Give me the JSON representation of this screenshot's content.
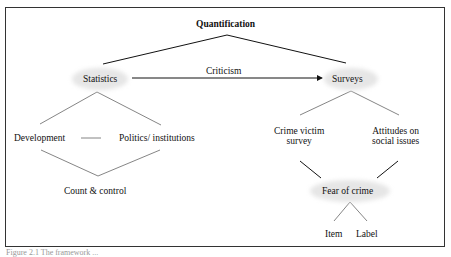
{
  "diagram": {
    "root": "Quantification",
    "edge_label": "Criticism",
    "left": {
      "node": "Statistics",
      "children": [
        "Development",
        "Politics/ institutions"
      ],
      "joined": "Count & control"
    },
    "right": {
      "node": "Surveys",
      "children": [
        {
          "line1": "Crime victim",
          "line2": "survey"
        },
        {
          "line1": "Attitudes on",
          "line2": "social issues"
        }
      ],
      "joined": "Fear of crime",
      "leaves": [
        "Item",
        "Label"
      ]
    }
  },
  "caption": "Figure 2.1  The framework ..."
}
